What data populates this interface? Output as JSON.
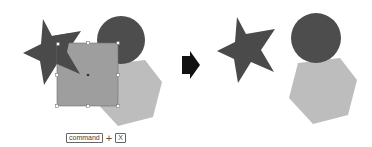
{
  "figure": {
    "colors": {
      "star": "#4a4a4a",
      "circle": "#4d4d4d",
      "hexagon": "#bdbdbd",
      "square_selected": "#9e9e9e",
      "selection_border": "#6e6e6e",
      "handle_fill": "#ffffff",
      "arrow": "#111111"
    },
    "before": {
      "shapes": [
        "star",
        "circle",
        "hexagon",
        "square (selected)"
      ]
    },
    "after": {
      "shapes": [
        "star",
        "circle",
        "hexagon"
      ]
    },
    "arrow_icon": "right-arrow-icon"
  },
  "shortcut": {
    "key1": "command",
    "plus": "+",
    "key2": "X"
  }
}
